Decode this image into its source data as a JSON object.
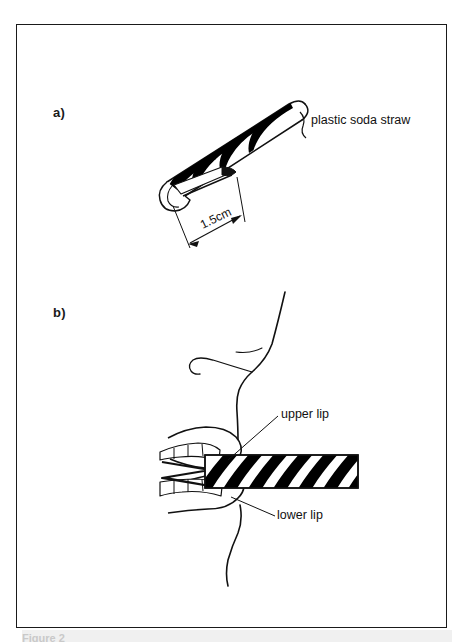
{
  "figure": {
    "panels": [
      {
        "id": "a",
        "label": "a)",
        "callouts": [
          {
            "name": "straw",
            "text": "plastic soda straw"
          }
        ],
        "dimensions": [
          {
            "name": "bevel-length",
            "text": "1.5cm"
          }
        ]
      },
      {
        "id": "b",
        "label": "b)",
        "callouts": [
          {
            "name": "upper-lip",
            "text": "upper lip"
          },
          {
            "name": "lower-lip",
            "text": "lower lip"
          }
        ]
      }
    ],
    "caption": "Figure 2",
    "colors": {
      "ink": "#111111",
      "frame": "#1a1a1a",
      "paper": "#ffffff",
      "stripe": "#000000",
      "caption_ghost": "#c9c9c9"
    }
  }
}
